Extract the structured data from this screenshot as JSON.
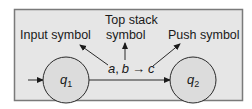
{
  "diagram": {
    "type": "pushdown-automaton-transition",
    "colors": {
      "frame_fill": "#e6e6e6",
      "frame_border": "#7a7a7a",
      "state_fill": "#dcdcdc",
      "stroke": "#2a2a2a",
      "text": "#1a1a1a"
    },
    "states": [
      {
        "id": "q1",
        "label": "q",
        "subscript": "1",
        "initial": true
      },
      {
        "id": "q2",
        "label": "q",
        "subscript": "2",
        "initial": false
      }
    ],
    "transition": {
      "from": "q1",
      "to": "q2",
      "input_symbol": "a",
      "separator": ",",
      "top_stack_symbol": "b",
      "arrow": "→",
      "push_symbol": "c"
    },
    "annotations": {
      "input_symbol": "Input symbol",
      "top_stack_line1": "Top stack",
      "top_stack_line2": "symbol",
      "push_symbol": "Push symbol"
    }
  }
}
